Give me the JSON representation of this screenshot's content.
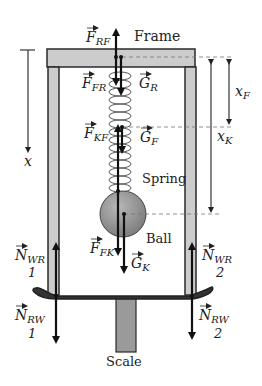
{
  "diagram": {
    "labels": {
      "frame": "Frame",
      "spring": "Spring",
      "ball": "Ball",
      "scale": "Scale"
    },
    "forces": {
      "F_RF": {
        "base": "F",
        "sub": "RF"
      },
      "F_FR": {
        "base": "F",
        "sub": "FR"
      },
      "G_R": {
        "base": "G",
        "sub": "R"
      },
      "F_KF": {
        "base": "F",
        "sub": "KF"
      },
      "G_F": {
        "base": "G",
        "sub": "F"
      },
      "F_FK": {
        "base": "F",
        "sub": "FK"
      },
      "G_K": {
        "base": "G",
        "sub": "K"
      },
      "N_WR_1": {
        "base": "N",
        "sub": "WR",
        "index": "1"
      },
      "N_WR_2": {
        "base": "N",
        "sub": "WR",
        "index": "2"
      },
      "N_RW_1": {
        "base": "N",
        "sub": "RW",
        "index": "1"
      },
      "N_RW_2": {
        "base": "N",
        "sub": "RW",
        "index": "2"
      }
    },
    "dimensions": {
      "x": {
        "base": "x",
        "sub": ""
      },
      "x_F": {
        "base": "x",
        "sub": "F"
      },
      "x_K": {
        "base": "x",
        "sub": "K"
      }
    },
    "colors": {
      "frame_fill": "#cccccc",
      "outline": "#2a2a2a",
      "ball_fill": "#8f8f8f",
      "scale_fill": "#9a9a9a",
      "arrow": "#111111",
      "dashed": "#777777"
    }
  }
}
